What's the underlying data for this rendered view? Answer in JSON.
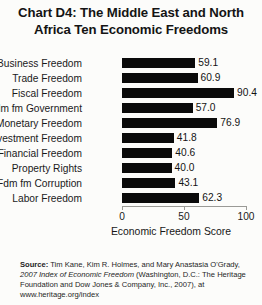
{
  "chart_data": {
    "type": "bar",
    "orientation": "horizontal",
    "title": "Chart D4: The Middle East and North Africa Ten Economic Freedoms",
    "title_line1": "Chart D4: The Middle East and North",
    "title_line2": "Africa Ten Economic Freedoms",
    "xlabel": "Economic Freedom Score",
    "ylabel": "",
    "xlim": [
      0,
      100
    ],
    "xticks": [
      0,
      50,
      100
    ],
    "xtick_labels": [
      "0",
      "50",
      "100"
    ],
    "grid": false,
    "legend": null,
    "bar_color": "#0a0a0a",
    "categories": [
      "Business Freedom",
      "Trade Freedom",
      "Fiscal Freedom",
      "Fdm fm Government",
      "Monetary Freedom",
      "Investment Freedom",
      "Financial Freedom",
      "Property Rights",
      "Fdm fm Corruption",
      "Labor Freedom"
    ],
    "values": [
      59.1,
      60.9,
      90.4,
      57.0,
      76.9,
      41.8,
      40.6,
      40.0,
      43.1,
      62.3
    ],
    "value_labels": [
      "59.1",
      "60.9",
      "90.4",
      "57.0",
      "76.9",
      "41.8",
      "40.6",
      "40.0",
      "43.1",
      "62.3"
    ]
  },
  "source": {
    "label": "Source:",
    "line1_rest": " Tim Kane, Kim R. Holmes, and Mary Anastasia O'Grady,",
    "italic_title": "2007 Index of Economic Freedom",
    "line2_rest": " (Washington, D.C.: The Heritage",
    "line3": "Foundation and Dow Jones & Company, Inc., 2007), at",
    "line4": "www.heritage.org/index"
  }
}
